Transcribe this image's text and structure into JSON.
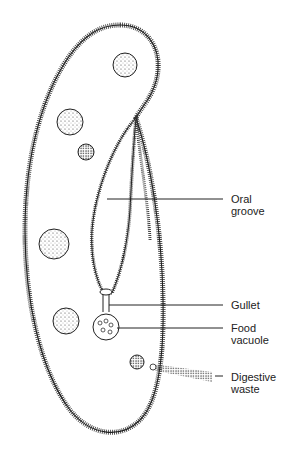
{
  "diagram": {
    "labels": [
      {
        "id": "oral-groove",
        "lines": [
          "Oral",
          "groove"
        ]
      },
      {
        "id": "gullet",
        "lines": [
          "Gullet"
        ]
      },
      {
        "id": "food-vacuole",
        "lines": [
          "Food",
          "vacuole"
        ]
      },
      {
        "id": "digestive-waste",
        "lines": [
          "Digestive",
          "waste"
        ]
      }
    ]
  }
}
